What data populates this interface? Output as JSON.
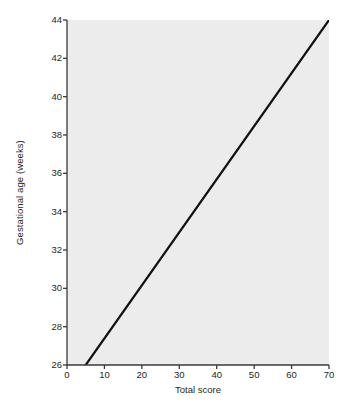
{
  "chart_data": {
    "type": "line",
    "title": "",
    "subtitle": "",
    "xlabel": "Total score",
    "ylabel": "Gestational age (weeks)",
    "xlim": [
      0,
      70
    ],
    "ylim": [
      26,
      44
    ],
    "xticks": [
      0,
      10,
      20,
      30,
      40,
      50,
      60,
      70
    ],
    "yticks": [
      26,
      28,
      30,
      32,
      34,
      36,
      38,
      40,
      42,
      44
    ],
    "xtick_labels": [
      "0",
      "10",
      "20",
      "30",
      "40",
      "50",
      "60",
      "70"
    ],
    "ytick_labels": [
      "26",
      "28",
      "30",
      "32",
      "34",
      "36",
      "38",
      "40",
      "42",
      "44"
    ],
    "grid": false,
    "legend": null,
    "legend_position": "none",
    "annotations": [],
    "series": [
      {
        "name": "Gestational age vs total score",
        "x": [
          5,
          70
        ],
        "y": [
          26,
          44
        ],
        "line_color": "#111111",
        "line_width": 2.2,
        "markers": false,
        "description": "Straight regression line rising from (5, 26) at the bottom axis to (70, 44) at the top-right corner"
      }
    ],
    "style": {
      "plot_background": "#ececec",
      "figure_background": "#ffffff",
      "axis_color": "#3a3a3a",
      "tick_color": "#3a3a3a",
      "text_color": "#262626"
    }
  }
}
